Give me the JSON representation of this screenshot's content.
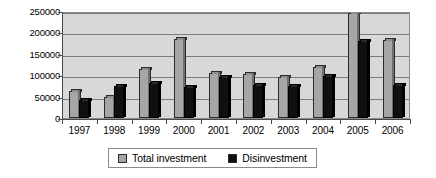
{
  "chart_data": {
    "type": "bar",
    "title": "",
    "subtitle": "",
    "xlabel": "",
    "ylabel": "",
    "categories": [
      "1997",
      "1998",
      "1999",
      "2000",
      "2001",
      "2002",
      "2003",
      "2004",
      "2005",
      "2006"
    ],
    "series": [
      {
        "name": "Total investment",
        "color": "#a6a6a6",
        "values": [
          62000,
          50000,
          115000,
          185000,
          105000,
          103000,
          95000,
          120000,
          245000,
          182000
        ]
      },
      {
        "name": "Disinvestment",
        "color": "#101010",
        "values": [
          42000,
          75000,
          82000,
          72000,
          95000,
          78000,
          75000,
          98000,
          180000,
          78000
        ]
      }
    ],
    "ylim": [
      0,
      250000
    ],
    "ytick_values": [
      0,
      50000,
      100000,
      150000,
      200000,
      250000
    ],
    "ytick_labels": [
      "0",
      "50000",
      "100000",
      "150000",
      "200000",
      "250000"
    ],
    "grid": true,
    "legend_position": "bottom",
    "plot_background": "#d8d8d8"
  },
  "legend": {
    "entries": [
      {
        "label": "Total investment",
        "swatch": "#a6a6a6"
      },
      {
        "label": "Disinvestment",
        "swatch": "#101010"
      }
    ]
  }
}
